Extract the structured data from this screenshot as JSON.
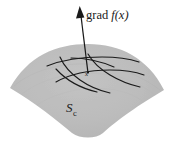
{
  "figure": {
    "caption_labels": {
      "gradient_roman": "grad",
      "gradient_italic": "f(x)",
      "surface_symbol": "S",
      "surface_subscript": "c",
      "point_symbol": "x"
    },
    "colors": {
      "surface_fill": "#b9b9b9",
      "surface_fill_edge": "#c6c6c6",
      "curve_stroke": "#1a1a1a",
      "arrow_stroke": "#1a1a1a",
      "background": "#ffffff",
      "text": "#1a1a1a"
    },
    "geometry": {
      "canvas_width": 175,
      "canvas_height": 147,
      "tangent_point": [
        88,
        72
      ],
      "arrow_tip": [
        80,
        7
      ],
      "surface_left_tip": [
        10,
        88
      ],
      "surface_right_tip": [
        164,
        90
      ],
      "surface_top_apex": [
        88,
        44
      ],
      "surface_bottom_apex": [
        86,
        133
      ]
    },
    "element_names": {
      "surface": "level-surface",
      "gradient_arrow": "gradient-vector-arrow",
      "tangent_curves": "tangent-plane-curves",
      "point_marker": "tangent-point-marker"
    }
  }
}
